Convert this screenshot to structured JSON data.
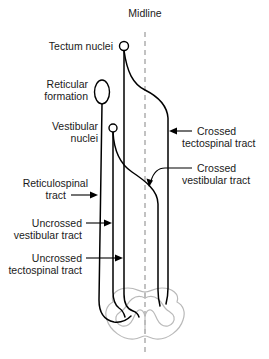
{
  "figure": {
    "midline_label": "Midline",
    "colors": {
      "tract_stroke": "#000000",
      "cord_outline": "#b9b9b9",
      "midline": "#9a9a9a",
      "text": "#1a1a1a",
      "background": "#ffffff"
    }
  },
  "labels": {
    "tectum_nuclei": "Tectum nuclei",
    "reticular_formation_line1": "Reticular",
    "reticular_formation_line2": "formation",
    "vestibular_nuclei_line1": "Vestibular",
    "vestibular_nuclei_line2": "nuclei",
    "reticulospinal_tract_line1": "Reticulospinal",
    "reticulospinal_tract_line2": "tract",
    "uncrossed_vestibular_line1": "Uncrossed",
    "uncrossed_vestibular_line2": "vestibular tract",
    "uncrossed_tectospinal_line1": "Uncrossed",
    "uncrossed_tectospinal_line2": "tectospinal tract",
    "crossed_tectospinal_line1": "Crossed",
    "crossed_tectospinal_line2": "tectospinal tract",
    "crossed_vestibular_line1": "Crossed",
    "crossed_vestibular_line2": "vestibular tract",
    "midline": "Midline"
  },
  "structures": [
    {
      "name": "tectum-nuclei",
      "type": "circle",
      "cx": 124,
      "cy": 46,
      "r": 4.5
    },
    {
      "name": "reticular-formation",
      "type": "ellipse",
      "cx": 102,
      "cy": 92,
      "rx": 7.5,
      "ry": 12
    },
    {
      "name": "vestibular-nuclei",
      "type": "circle",
      "cx": 113,
      "cy": 128,
      "r": 4.0
    }
  ],
  "tracts": [
    {
      "name": "uncrossed-tectospinal-tract",
      "origin": "tectum-nuclei",
      "side": "ipsilateral",
      "x_column": 124
    },
    {
      "name": "crossed-tectospinal-tract",
      "origin": "tectum-nuclei",
      "side": "contralateral",
      "x_column": 168
    },
    {
      "name": "uncrossed-vestibular-tract",
      "origin": "vestibular-nuclei",
      "side": "ipsilateral",
      "x_column": 113
    },
    {
      "name": "crossed-vestibular-tract",
      "origin": "vestibular-nuclei",
      "side": "contralateral",
      "x_column": 158
    },
    {
      "name": "reticulospinal-tract",
      "origin": "reticular-formation",
      "side": "ipsilateral",
      "x_column": 99
    }
  ],
  "midline_geometry": {
    "x": 145,
    "y_top": 32,
    "y_bottom": 352
  }
}
